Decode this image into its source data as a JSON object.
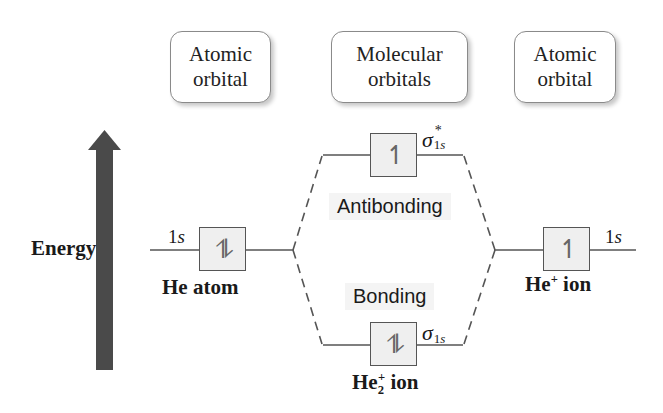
{
  "headers": {
    "left": "Atomic orbital",
    "left_line1": "Atomic",
    "left_line2": "orbital",
    "middle_line1": "Molecular",
    "middle_line2": "orbitals",
    "right_line1": "Atomic",
    "right_line2": "orbital"
  },
  "energy_axis": {
    "label": "Energy",
    "arrow_color": "#4a4a4a",
    "direction": "up"
  },
  "left_atom": {
    "orbital_label": "1s",
    "electrons": "⥮",
    "electron_count": 2,
    "species_label": "He atom"
  },
  "right_atom": {
    "orbital_label": "1s",
    "electrons": "↿",
    "electron_count": 1,
    "species_base": "He",
    "species_charge": "+",
    "species_suffix": "ion"
  },
  "antibonding": {
    "region_label": "Antibonding",
    "orbital_symbol": "σ",
    "orbital_superscript": "*",
    "orbital_subscript": "1s",
    "electrons": "↿",
    "electron_count": 1
  },
  "bonding": {
    "region_label": "Bonding",
    "orbital_symbol": "σ",
    "orbital_subscript": "1s",
    "electrons": "⥮",
    "electron_count": 2
  },
  "molecule": {
    "species_base": "He",
    "species_subscript": "2",
    "species_charge": "+",
    "species_suffix": "ion"
  },
  "colors": {
    "line": "#555555",
    "box_fill": "#efefef",
    "arrow": "#4a4a4a"
  }
}
